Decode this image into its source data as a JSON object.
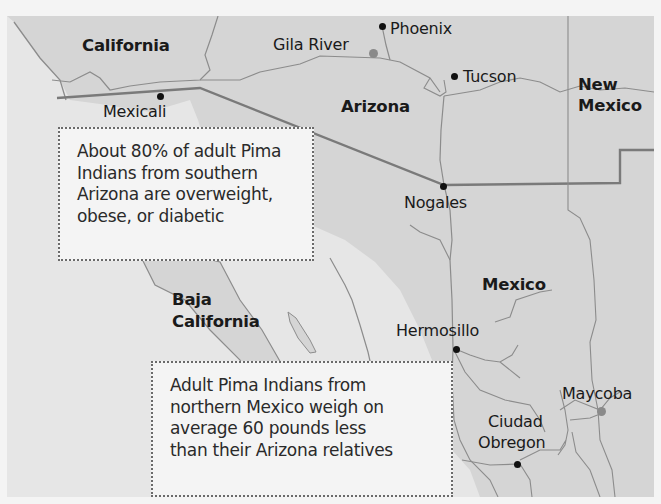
{
  "map": {
    "background_color": "#e6e6e6",
    "land_color": "#d5d5d5",
    "water_color": "#e6e6e6",
    "border_color": "#8c8c8c",
    "highlight_marker_color": "#8a8a8a",
    "regions": [
      {
        "id": "california",
        "label": "California"
      },
      {
        "id": "arizona",
        "label": "Arizona"
      },
      {
        "id": "new-mexico",
        "label_line1": "New",
        "label_line2": "Mexico"
      },
      {
        "id": "baja-california",
        "label_line1": "Baja",
        "label_line2": "California"
      },
      {
        "id": "mexico",
        "label": "Mexico"
      }
    ],
    "cities": [
      {
        "id": "phoenix",
        "label": "Phoenix",
        "marker": "black-dot"
      },
      {
        "id": "gila-river",
        "label": "Gila River",
        "marker": "gray-dot"
      },
      {
        "id": "tucson",
        "label": "Tucson",
        "marker": "black-dot"
      },
      {
        "id": "mexicali",
        "label": "Mexicali",
        "marker": "black-dot"
      },
      {
        "id": "nogales",
        "label": "Nogales",
        "marker": "black-dot"
      },
      {
        "id": "hermosillo",
        "label": "Hermosillo",
        "marker": "black-dot"
      },
      {
        "id": "maycoba",
        "label": "Maycoba",
        "marker": "gray-dot"
      },
      {
        "id": "ciudad-obregon",
        "label_line1": "Ciudad",
        "label_line2": "Obregon",
        "marker": "black-dot"
      }
    ]
  },
  "callouts": {
    "arizona": {
      "lines": [
        "About 80% of adult Pima",
        "Indians from southern",
        "Arizona are overweight,",
        "obese, or diabetic"
      ]
    },
    "mexico": {
      "lines": [
        "Adult Pima Indians from",
        "northern Mexico weigh on",
        "average 60 pounds less",
        "than their Arizona relatives"
      ]
    }
  }
}
